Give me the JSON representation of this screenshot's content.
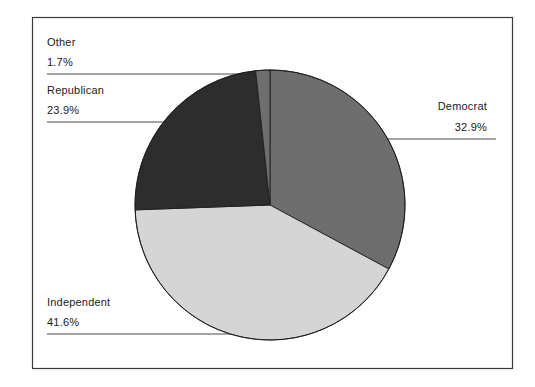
{
  "chart_data": {
    "type": "pie",
    "title": "",
    "categories": [
      "Democrat",
      "Independent",
      "Republican",
      "Other"
    ],
    "values": [
      32.9,
      41.6,
      23.9,
      1.7
    ],
    "value_labels": [
      "32.9%",
      "41.6%",
      "23.9%",
      "1.7%"
    ],
    "unit": "%",
    "legend": "none",
    "labels_position": "outside-with-leader-lines",
    "start_angle_deg": 0,
    "direction": "clockwise",
    "slice_colors": [
      "#6e6e6e",
      "#d5d5d5",
      "#2d2d2d",
      "#6e6e6e"
    ],
    "border_color": "#000000",
    "frame": true
  },
  "slices": [
    {
      "name": "Democrat",
      "value": 32.9,
      "value_label": "32.9%",
      "color": "#6e6e6e"
    },
    {
      "name": "Independent",
      "value": 41.6,
      "value_label": "41.6%",
      "color": "#d5d5d5"
    },
    {
      "name": "Republican",
      "value": 23.9,
      "value_label": "23.9%",
      "color": "#2d2d2d"
    },
    {
      "name": "Other",
      "value": 1.7,
      "value_label": "1.7%",
      "color": "#6e6e6e"
    }
  ],
  "labels": {
    "other": {
      "name": "Other",
      "value": "1.7%"
    },
    "republican": {
      "name": "Republican",
      "value": "23.9%"
    },
    "independent": {
      "name": "Independent",
      "value": "41.6%"
    },
    "democrat": {
      "name": "Democrat",
      "value": "32.9%"
    }
  }
}
